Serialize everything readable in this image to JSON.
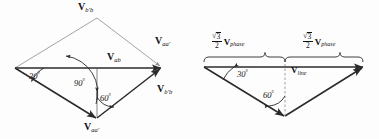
{
  "figure": {
    "type": "vector-phasor-diagram",
    "background_color": "#fdfdfd",
    "stroke_color": "#2a2a2a",
    "dashed_color": "#8c8c8c",
    "panels": [
      {
        "id": "left",
        "name": "phasor-diagram-labelled",
        "labels": [
          {
            "name": "label-vbb-top",
            "main": "V",
            "sub": "b′b",
            "x": 78,
            "y": 2
          },
          {
            "name": "label-vaa-right",
            "main": "V",
            "sub": "aa′",
            "x": 155,
            "y": 36
          },
          {
            "name": "label-vab",
            "main": "V",
            "sub": "ab",
            "x": 107,
            "y": 52
          },
          {
            "name": "label-vbb-right",
            "main": "V",
            "sub": "b′b",
            "x": 157,
            "y": 84
          },
          {
            "name": "label-vaa-bottom",
            "main": "V",
            "sub": "aa′",
            "x": 84,
            "y": 122
          }
        ],
        "angles": [
          {
            "name": "angle-30",
            "text": "30",
            "unit": "°",
            "x": 29,
            "y": 71
          },
          {
            "name": "angle-90",
            "text": "90",
            "unit": "°",
            "x": 74,
            "y": 78
          },
          {
            "name": "angle-60",
            "text": "60",
            "unit": "°",
            "x": 100,
            "y": 93
          }
        ]
      },
      {
        "id": "right",
        "name": "phasor-diagram-magnitudes",
        "labels": [
          {
            "name": "label-sqrt3-over-2-vphase-left",
            "numerator": "3",
            "denominator": "2",
            "main": "V",
            "sub": "phase",
            "x": 22,
            "y": 32
          },
          {
            "name": "label-sqrt3-over-2-vphase-right",
            "numerator": "3",
            "denominator": "2",
            "main": "V",
            "sub": "phase",
            "x": 113,
            "y": 32
          },
          {
            "name": "label-vline",
            "main": "V",
            "sub": "line",
            "x": 101,
            "y": 66
          }
        ],
        "angles": [
          {
            "name": "angle-30",
            "text": "30",
            "unit": "°",
            "x": 47,
            "y": 69
          },
          {
            "name": "angle-60",
            "text": "60",
            "unit": "°",
            "x": 73,
            "y": 90
          }
        ]
      }
    ]
  }
}
